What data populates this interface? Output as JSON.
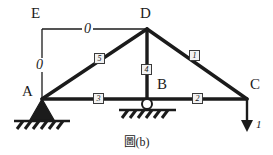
{
  "figure": {
    "caption": "圖(b)",
    "background_color": "#ffffff",
    "line_color": "#1b1b1b",
    "tag_fill_color": "#f2f2f2"
  },
  "nodes": [
    {
      "id": "A",
      "label": "A",
      "x": 42,
      "y": 99,
      "support": "pin"
    },
    {
      "id": "B",
      "label": "B",
      "x": 147,
      "y": 99,
      "support": "roller"
    },
    {
      "id": "C",
      "label": "C",
      "x": 247,
      "y": 99,
      "support": "none"
    },
    {
      "id": "D",
      "label": "D",
      "x": 147,
      "y": 29,
      "support": "none"
    },
    {
      "id": "E",
      "label": "E",
      "x": 42,
      "y": 29,
      "support": "none"
    }
  ],
  "members": [
    {
      "tag": "1",
      "from": "D",
      "to": "C"
    },
    {
      "tag": "2",
      "from": "B",
      "to": "C"
    },
    {
      "tag": "3",
      "from": "A",
      "to": "B"
    },
    {
      "tag": "4",
      "from": "D",
      "to": "B"
    },
    {
      "tag": "5",
      "from": "A",
      "to": "D"
    }
  ],
  "zero_force_labels": [
    {
      "id": "zero-horizontal-ed",
      "value": "0"
    },
    {
      "id": "zero-vertical-ea",
      "value": "0"
    }
  ],
  "load": {
    "label": "1",
    "direction": "down",
    "at_node": "C"
  }
}
